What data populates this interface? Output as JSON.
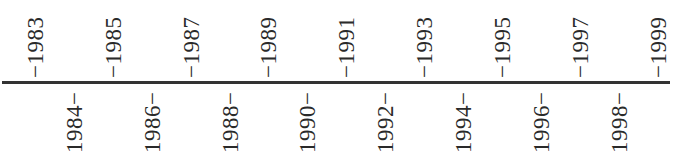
{
  "timeline": {
    "start_year": 1983,
    "end_year": 1999,
    "axis_color": "#333333",
    "text_color": "#2a2a2a",
    "above": [
      {
        "year": "1983",
        "label": "−1983",
        "x": 35
      },
      {
        "year": "1985",
        "label": "−1985",
        "x": 113
      },
      {
        "year": "1987",
        "label": "−1987",
        "x": 191
      },
      {
        "year": "1989",
        "label": "−1989",
        "x": 268
      },
      {
        "year": "1991",
        "label": "−1991",
        "x": 346
      },
      {
        "year": "1993",
        "label": "−1993",
        "x": 424
      },
      {
        "year": "1995",
        "label": "−1995",
        "x": 502
      },
      {
        "year": "1997",
        "label": "−1997",
        "x": 580
      },
      {
        "year": "1999",
        "label": "−1999",
        "x": 658
      }
    ],
    "below": [
      {
        "year": "1984",
        "label": "1984−",
        "x": 74
      },
      {
        "year": "1986",
        "label": "1986−",
        "x": 152
      },
      {
        "year": "1988",
        "label": "1988−",
        "x": 230
      },
      {
        "year": "1990",
        "label": "1990−",
        "x": 307
      },
      {
        "year": "1992",
        "label": "1992−",
        "x": 385
      },
      {
        "year": "1994",
        "label": "1994−",
        "x": 463
      },
      {
        "year": "1996",
        "label": "1996−",
        "x": 541
      },
      {
        "year": "1998",
        "label": "1998−",
        "x": 619
      }
    ]
  }
}
